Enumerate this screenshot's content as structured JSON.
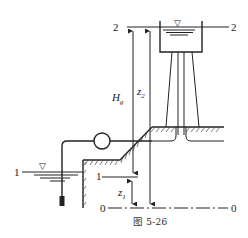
{
  "figure": {
    "caption": "图 5-26"
  },
  "levels": {
    "level2_left": "2",
    "level2_right": "2",
    "level1_left": "1",
    "level1_right": "1",
    "datum_left": "0",
    "datum_right": "0"
  },
  "dimensions": {
    "hg_main": "H",
    "hg_sub": "g",
    "z2_main": "z",
    "z2_sub": "2",
    "z1_main": "z",
    "z1_sub": "1"
  },
  "symbols": {
    "free_surface_marker": "▽"
  },
  "colors": {
    "line": "#222222",
    "background": "#ffffff"
  }
}
